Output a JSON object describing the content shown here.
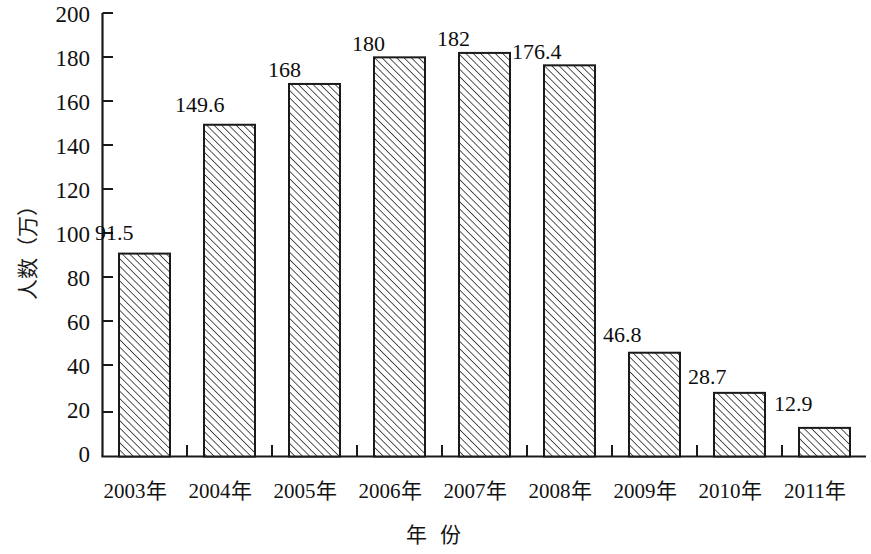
{
  "chart_data": {
    "type": "bar",
    "title": "",
    "subtitle": "",
    "xlabel": "年 份",
    "ylabel": "人数（万）",
    "categories": [
      "2003年",
      "2004年",
      "2005年",
      "2006年",
      "2007年",
      "2008年",
      "2009年",
      "2010年",
      "2011年"
    ],
    "values": [
      91.5,
      149.6,
      168,
      180,
      182,
      176.4,
      46.8,
      28.7,
      12.9
    ],
    "value_labels": [
      "91.5",
      "149.6",
      "168",
      "180",
      "182",
      "176.4",
      "46.8",
      "28.7",
      "12.9"
    ],
    "ylim": [
      0,
      200
    ],
    "ytick_step": 20,
    "ytick_labels": [
      "200",
      "180",
      "160",
      "140",
      "120",
      "100",
      "80",
      "60",
      "40",
      "20",
      "0"
    ],
    "ytick_values": [
      200,
      180,
      160,
      140,
      120,
      100,
      80,
      60,
      40,
      20,
      0
    ],
    "grid": false,
    "legend": false,
    "legend_position": "none",
    "bar_fill": "#ffffff",
    "bar_pattern": "diagonal-hatch",
    "bar_border_color": "#1a1a1a",
    "axis_color": "#1a1a1a",
    "background": "#ffffff"
  }
}
